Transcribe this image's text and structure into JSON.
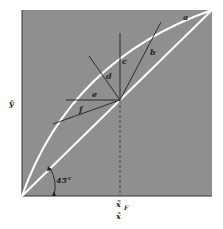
{
  "diagram": {
    "type": "McCabe-Thiele q-line diagram",
    "background_color": "#8f8f8f",
    "curve_color": "#ffffff",
    "line_color": "#222222",
    "axes": {
      "x_label": "x̃",
      "y_label": "ỹ",
      "feed_label": "x̃",
      "feed_subscript": "F"
    },
    "angle_label": "45°",
    "curves": {
      "equilibrium": "a",
      "diagonal": "45° line"
    },
    "q_lines": [
      {
        "label": "b"
      },
      {
        "label": "c"
      },
      {
        "label": "d"
      },
      {
        "label": "e"
      },
      {
        "label": "f"
      }
    ],
    "curve_label": "a"
  }
}
